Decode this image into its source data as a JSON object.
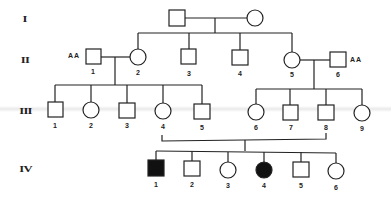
{
  "generations": [
    {
      "label": "I"
    },
    {
      "label": "II"
    },
    {
      "label": "III"
    },
    {
      "label": "IV"
    }
  ],
  "individuals": {
    "I": [
      {
        "id": "I-m",
        "sex": "male",
        "affected": false,
        "label": ""
      },
      {
        "id": "I-f",
        "sex": "female",
        "affected": false,
        "label": ""
      }
    ],
    "II": [
      {
        "id": "II-1",
        "sex": "male",
        "affected": false,
        "label": "1",
        "genotype": "AA"
      },
      {
        "id": "II-2",
        "sex": "female",
        "affected": false,
        "label": "2"
      },
      {
        "id": "II-3",
        "sex": "male",
        "affected": false,
        "label": "3"
      },
      {
        "id": "II-4",
        "sex": "male",
        "affected": false,
        "label": "4"
      },
      {
        "id": "II-5",
        "sex": "female",
        "affected": false,
        "label": "5"
      },
      {
        "id": "II-6",
        "sex": "male",
        "affected": false,
        "label": "6",
        "genotype": "AA"
      }
    ],
    "III": [
      {
        "id": "III-1",
        "sex": "male",
        "affected": false,
        "label": "1"
      },
      {
        "id": "III-2",
        "sex": "female",
        "affected": false,
        "label": "2"
      },
      {
        "id": "III-3",
        "sex": "male",
        "affected": false,
        "label": "3"
      },
      {
        "id": "III-4",
        "sex": "female",
        "affected": false,
        "label": "4"
      },
      {
        "id": "III-5",
        "sex": "male",
        "affected": false,
        "label": "5"
      },
      {
        "id": "III-6",
        "sex": "female",
        "affected": false,
        "label": "6"
      },
      {
        "id": "III-7",
        "sex": "male",
        "affected": false,
        "label": "7"
      },
      {
        "id": "III-8",
        "sex": "male",
        "affected": false,
        "label": "8"
      },
      {
        "id": "III-9",
        "sex": "female",
        "affected": false,
        "label": "9"
      }
    ],
    "IV": [
      {
        "id": "IV-1",
        "sex": "male",
        "affected": true,
        "label": "1"
      },
      {
        "id": "IV-2",
        "sex": "male",
        "affected": false,
        "label": "2"
      },
      {
        "id": "IV-3",
        "sex": "female",
        "affected": false,
        "label": "3"
      },
      {
        "id": "IV-4",
        "sex": "female",
        "affected": true,
        "label": "4"
      },
      {
        "id": "IV-5",
        "sex": "male",
        "affected": false,
        "label": "5"
      },
      {
        "id": "IV-6",
        "sex": "female",
        "affected": false,
        "label": "6"
      }
    ]
  },
  "genotype_labels": {
    "II1": "AA",
    "II6": "AA"
  },
  "colors": {
    "line": "#222222",
    "affected": "#111111",
    "unaffected": "#ffffff"
  }
}
